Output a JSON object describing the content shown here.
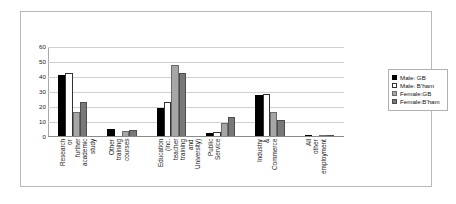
{
  "chart_data": {
    "type": "bar",
    "title": "",
    "xlabel": "",
    "ylabel": "",
    "ylim": [
      0,
      60
    ],
    "yticks": [
      0,
      10,
      20,
      30,
      40,
      50,
      60
    ],
    "grid": true,
    "legend_position": "right",
    "categories": [
      "Research or further academic study",
      "Other training courses",
      "Education (inc. teacher training and University)",
      "Public Service",
      "Industry & Commerce",
      "All other employment"
    ],
    "series": [
      {
        "name": "Male: GB",
        "color": "#000000",
        "values": [
          41.2,
          5.5,
          19.3,
          2.8,
          27.8,
          0.5
        ]
      },
      {
        "name": "Male: B'ham",
        "color": "#ffffff",
        "values": [
          42.8,
          0.0,
          23.5,
          3.5,
          28.5,
          0.0
        ]
      },
      {
        "name": "Female:GB",
        "color": "#a6a6a6",
        "values": [
          17.0,
          4.0,
          48.2,
          9.3,
          17.0,
          1.5
        ]
      },
      {
        "name": "Female:B'ham",
        "color": "#787878",
        "values": [
          23.6,
          5.0,
          42.7,
          13.1,
          11.3,
          1.0
        ]
      }
    ]
  },
  "legend": {
    "items": [
      {
        "label": "Male: GB"
      },
      {
        "label": "Male: B'ham"
      },
      {
        "label": "Female:GB"
      },
      {
        "label": "Female:B'ham"
      }
    ]
  },
  "axis": {
    "y_tick_labels": [
      "60",
      "50",
      "40",
      "30",
      "20",
      "10",
      "0"
    ]
  }
}
